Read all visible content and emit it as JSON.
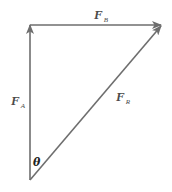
{
  "diagram": {
    "type": "vector-triangle",
    "colors": {
      "line": "#6e6e6e",
      "label": "#4a4a4a",
      "angle_label": "#222222",
      "background": "#ffffff"
    },
    "vectors": [
      {
        "id": "FA",
        "name": "F",
        "subscript": "A",
        "direction": "up"
      },
      {
        "id": "FB",
        "name": "F",
        "subscript": "B",
        "direction": "right"
      },
      {
        "id": "FR",
        "name": "F",
        "subscript": "R",
        "direction": "diagonal-up-right"
      }
    ],
    "angle": {
      "symbol": "θ"
    }
  }
}
